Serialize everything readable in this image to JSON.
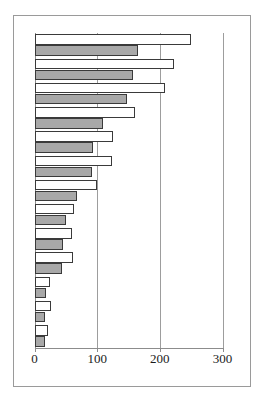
{
  "figure": {
    "frame_visible": true,
    "background_color": "#ffffff"
  },
  "axis": {
    "tick_labels": [
      "0",
      "100",
      "200",
      "300"
    ],
    "tick_values": [
      0,
      100,
      200,
      300
    ]
  },
  "chart_data": {
    "type": "bar",
    "orientation": "horizontal",
    "title": "",
    "subtitle": "",
    "xlabel": "",
    "ylabel": "",
    "xlim": [
      0,
      300
    ],
    "xticks": [
      0,
      100,
      200,
      300
    ],
    "xticklabels": [
      "0",
      "100",
      "200",
      "300"
    ],
    "grid": true,
    "grid_axis": "x",
    "legend": false,
    "legend_position": "none",
    "categories": [
      "1",
      "2",
      "3",
      "4",
      "5",
      "6",
      "7",
      "8",
      "9",
      "10",
      "11",
      "12",
      "13"
    ],
    "series": [
      {
        "name": "white",
        "color": "#ffffff",
        "edge_color": "#3a3a3a",
        "values": [
          249,
          222,
          208,
          160,
          126,
          124,
          100,
          63,
          60,
          62,
          25,
          26,
          22
        ]
      },
      {
        "name": "gray",
        "color": "#a8a8a8",
        "edge_color": "#3a3a3a",
        "values": [
          165,
          157,
          147,
          110,
          94,
          92,
          68,
          50,
          46,
          44,
          19,
          17,
          17
        ]
      }
    ]
  }
}
